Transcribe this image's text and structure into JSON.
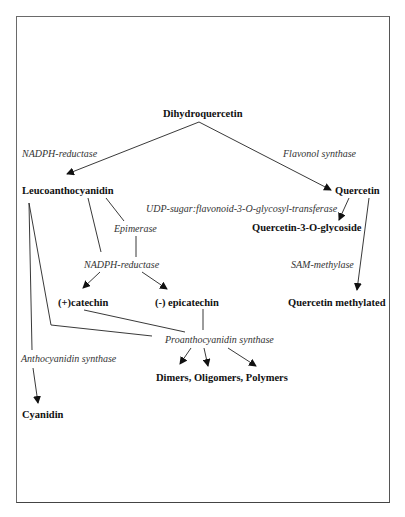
{
  "diagram": {
    "type": "biosynthetic-pathway",
    "nodes": {
      "dihydroquercetin": "Dihydroquercetin",
      "leucoanthocyanidin": "Leucoanthocyanidin",
      "quercetin": "Quercetin",
      "quercetin_glycoside": "Quercetin-3-O-glycoside",
      "catechin": "(+)catechin",
      "epicatechin": "(-) epicatechin",
      "quercetin_methylated": "Quercetin methylated",
      "polymers": "Dimers, Oligomers, Polymers",
      "cyanidin": "Cyanidin"
    },
    "enzymes": {
      "nadph_reductase_1": "NADPH-reductase",
      "flavonol_synthase": "Flavonol synthase",
      "udp_transferase": "UDP-sugar:flavonoid-3-O-glycosyl-transferase",
      "epimerase": "Epimerase",
      "nadph_reductase_2": "NADPH-reductase",
      "sam_methylase": "SAM-methylase",
      "proanthocyanidin_synthase": "Proanthocyanidin synthase",
      "anthocyanidin_synthase": "Anthocyanidin synthase"
    },
    "edges": [
      {
        "from": "Dihydroquercetin",
        "to": "Leucoanthocyanidin",
        "enzyme": "NADPH-reductase"
      },
      {
        "from": "Dihydroquercetin",
        "to": "Quercetin",
        "enzyme": "Flavonol synthase"
      },
      {
        "from": "Quercetin",
        "to": "Quercetin-3-O-glycoside",
        "enzyme": "UDP-sugar:flavonoid-3-O-glycosyl-transferase"
      },
      {
        "from": "Quercetin",
        "to": "Quercetin methylated",
        "enzyme": "SAM-methylase"
      },
      {
        "from": "Leucoanthocyanidin",
        "to": "(+)catechin",
        "enzyme": "NADPH-reductase"
      },
      {
        "from": "Leucoanthocyanidin",
        "to": "(-) epicatechin",
        "enzyme": "Epimerase / NADPH-reductase"
      },
      {
        "from": "Leucoanthocyanidin",
        "to": "Dimers, Oligomers, Polymers",
        "enzyme": "Proanthocyanidin synthase"
      },
      {
        "from": "(+)catechin",
        "to": "Dimers, Oligomers, Polymers",
        "enzyme": "Proanthocyanidin synthase"
      },
      {
        "from": "(-) epicatechin",
        "to": "Dimers, Oligomers, Polymers",
        "enzyme": "Proanthocyanidin synthase"
      },
      {
        "from": "Leucoanthocyanidin",
        "to": "Cyanidin",
        "enzyme": "Anthocyanidin synthase"
      }
    ]
  }
}
